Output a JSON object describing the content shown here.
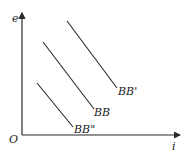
{
  "diagram": {
    "type": "line-diagram",
    "axes": {
      "x_label": "i",
      "y_label": "e",
      "origin_label": "O"
    },
    "curves": [
      {
        "name": "BB'",
        "label": "BB'",
        "x1": 67,
        "y1": 21,
        "x2": 117,
        "y2": 88
      },
      {
        "name": "BB",
        "label": "BB",
        "x1": 43,
        "y1": 42,
        "x2": 94,
        "y2": 109
      },
      {
        "name": "BB''",
        "label": "BB\"",
        "x1": 37,
        "y1": 83,
        "x2": 73,
        "y2": 127
      }
    ],
    "colors": {
      "line": "#2a2a2a",
      "text": "#222222",
      "background": "#ffffff"
    }
  }
}
